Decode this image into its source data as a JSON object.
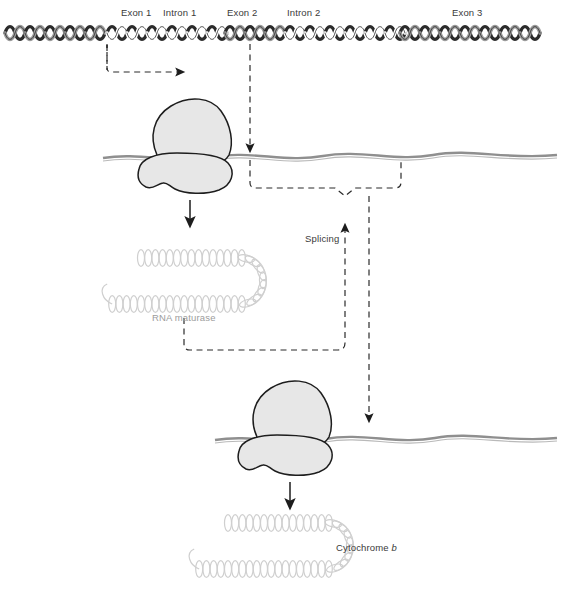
{
  "figure": {
    "caption": ""
  },
  "gene_map": {
    "labels": [
      {
        "id": "exon-1",
        "text": "Exon 1",
        "x": 121,
        "y": 8
      },
      {
        "id": "intron-1",
        "text": "Intron 1",
        "x": 163,
        "y": 8
      },
      {
        "id": "exon-2",
        "text": "Exon 2",
        "x": 227,
        "y": 8
      },
      {
        "id": "intron-2",
        "text": "Intron 2",
        "x": 287,
        "y": 8
      },
      {
        "id": "exon-3",
        "text": "Exon 3",
        "x": 452,
        "y": 8
      }
    ],
    "segments": [
      {
        "name": "exon-1",
        "type": "exon",
        "x0": 5,
        "x1": 107,
        "fill": "#9a9a9a"
      },
      {
        "name": "intron-1",
        "type": "intron",
        "x0": 107,
        "x1": 225,
        "fill": "#ffffff"
      },
      {
        "name": "exon-2",
        "type": "exon",
        "x0": 225,
        "x1": 285,
        "fill": "#9a9a9a"
      },
      {
        "name": "intron-2",
        "type": "intron",
        "x0": 285,
        "x1": 400,
        "fill": "#ffffff"
      },
      {
        "name": "exon-3",
        "type": "exon",
        "x0": 400,
        "x1": 557,
        "fill": "#9a9a9a"
      }
    ]
  },
  "process_labels": {
    "splicing": "Splicing",
    "rna_maturase": "RNA maturase",
    "cytochrome_prefix": "Cytochrome ",
    "cytochrome_gene": "b"
  },
  "colors": {
    "helix_exon": "#9a9a9a",
    "helix_stroke": "#2b2b2b",
    "ribosome_fill": "#e7e7e7",
    "ribosome_stroke": "#1d1d1d",
    "rna_strand": "#8f8f8f",
    "protein_coil": "#cfcfcf",
    "dashed_flow": "#2b2b2b",
    "text": "#3a3a3a",
    "background": "#ffffff"
  }
}
